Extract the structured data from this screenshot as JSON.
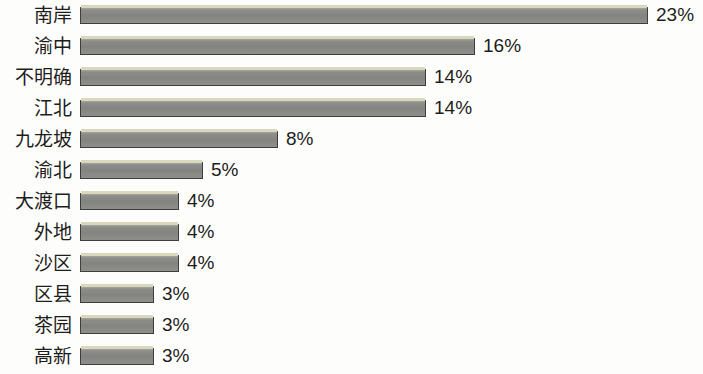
{
  "chart_data": {
    "type": "bar",
    "orientation": "horizontal",
    "title": "",
    "subtitle": "",
    "xlabel": "",
    "ylabel": "",
    "grid": false,
    "legend": null,
    "axis_visible": false,
    "value_suffix": "%",
    "xlim": [
      0,
      23
    ],
    "categories": [
      "南岸",
      "渝中",
      "不明确",
      "江北",
      "九龙坡",
      "渝北",
      "大渡口",
      "外地",
      "沙区",
      "区县",
      "茶园",
      "高新"
    ],
    "values": [
      23,
      16,
      14,
      14,
      8,
      5,
      4,
      4,
      4,
      3,
      3,
      3
    ],
    "value_labels": [
      "23%",
      "16%",
      "14%",
      "14%",
      "8%",
      "5%",
      "4%",
      "4%",
      "4%",
      "3%",
      "3%",
      "3%"
    ],
    "colors": {
      "bar_fill": "#8a8a88",
      "bar_border": "#3e3e3c",
      "bar_highlight": "#d8d8bd",
      "text": "#1d1d1b",
      "background": "#fdfdfc"
    }
  },
  "rows": [
    {
      "label": "南岸",
      "value": 23,
      "value_label": "23%"
    },
    {
      "label": "渝中",
      "value": 16,
      "value_label": "16%"
    },
    {
      "label": "不明确",
      "value": 14,
      "value_label": "14%"
    },
    {
      "label": "江北",
      "value": 14,
      "value_label": "14%"
    },
    {
      "label": "九龙坡",
      "value": 8,
      "value_label": "8%"
    },
    {
      "label": "渝北",
      "value": 5,
      "value_label": "5%"
    },
    {
      "label": "大渡口",
      "value": 4,
      "value_label": "4%"
    },
    {
      "label": "外地",
      "value": 4,
      "value_label": "4%"
    },
    {
      "label": "沙区",
      "value": 4,
      "value_label": "4%"
    },
    {
      "label": "区县",
      "value": 3,
      "value_label": "3%"
    },
    {
      "label": "茶园",
      "value": 3,
      "value_label": "3%"
    },
    {
      "label": "高新",
      "value": 3,
      "value_label": "3%"
    }
  ],
  "geometry": {
    "bar_origin_x": 80,
    "row_pitch": 31,
    "row_top_offset": 0,
    "bar_height": 17,
    "bar_top_in_row": 7,
    "label_gap": 8,
    "min_bar_px": 80,
    "px_per_unit": 24.7
  }
}
